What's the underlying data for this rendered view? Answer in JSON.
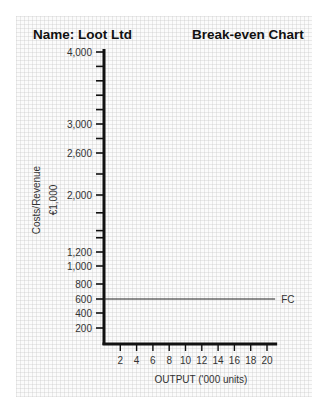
{
  "header": {
    "name_label": "Name: Loot Ltd",
    "chart_title": "Break-even Chart"
  },
  "axes": {
    "y_label_line1": "Costs/Revenue",
    "y_label_line2": "€1,000",
    "x_label": "OUTPUT ('000 units)"
  },
  "lines": {
    "fc_label": "FC"
  },
  "colors": {
    "axis": "#111111",
    "grid": "#e2e2e2",
    "text": "#333333"
  },
  "chart_data": {
    "type": "line",
    "title": "Break-even Chart",
    "subtitle": "Name: Loot Ltd",
    "xlabel": "OUTPUT ('000 units)",
    "ylabel": "Costs/Revenue €1,000",
    "x_ticks": [
      2,
      4,
      6,
      8,
      10,
      12,
      14,
      16,
      18,
      20
    ],
    "y_tick_labels": [
      200,
      400,
      600,
      800,
      1000,
      1200,
      2000,
      2600,
      3000,
      4000
    ],
    "xlim": [
      0,
      21
    ],
    "ylim": [
      0,
      4000
    ],
    "grid": true,
    "series": [
      {
        "name": "FC",
        "x": [
          0,
          21
        ],
        "values": [
          600,
          600
        ]
      }
    ],
    "annotations": [
      "FC"
    ]
  }
}
